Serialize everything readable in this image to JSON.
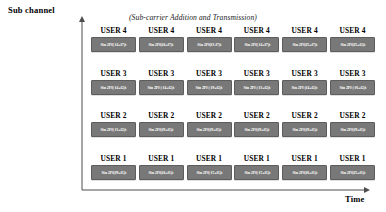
{
  "diagram": {
    "title": "(Sub-carrier Addition and Transmission)",
    "y_axis_label": "Sub channel",
    "x_axis_label": "Time",
    "box_fill_color": "#787878",
    "box_text_color": "#ffffff",
    "axis_color": "#4d4d4d",
    "rows": [
      {
        "user_label": "USER 4",
        "cells": [
          {
            "label": "USER 4",
            "expression": "Sin 2Pf( f4+f7)t"
          },
          {
            "label": "USER 4",
            "expression": "Sin 2Pf(f4+f7)t"
          },
          {
            "label": "USER 4",
            "expression": "Sin 2Pf(f3-f7)t"
          },
          {
            "label": "USER 4",
            "expression": "Sin 2Pf( f4+f7)t"
          },
          {
            "label": "USER 4",
            "expression": "Sin 2Pf(f5+f7)t"
          },
          {
            "label": "USER 4",
            "expression": "Sin 2Pf(f5+f2)t"
          }
        ]
      },
      {
        "user_label": "USER 3",
        "cells": [
          {
            "label": "USER 3",
            "expression": "Sin 2Pf( f4+f2)t"
          },
          {
            "label": "USER 3",
            "expression": "Sin 2Pf ( f4+f2)t"
          },
          {
            "label": "USER 3",
            "expression": "Sin 2Pf ( f9+f2)t"
          },
          {
            "label": "USER 3",
            "expression": "Sin 2Pf ( f3+f2)t"
          },
          {
            "label": "USER 3",
            "expression": "Sin 2Pf (f4+f2)t"
          },
          {
            "label": "USER 3",
            "expression": "Sin 2Pf ( f6+f2)t"
          }
        ]
      },
      {
        "user_label": "USER 2",
        "cells": [
          {
            "label": "USER 2",
            "expression": "Sin 2Pf( f1+f2)t"
          },
          {
            "label": "USER 2",
            "expression": "Sin 2Pf(f9+f1)t"
          },
          {
            "label": "USER 2",
            "expression": "Sin 2Pf(f9+f1)t"
          },
          {
            "label": "USER 2",
            "expression": "Sin 2Pf(f9+f1)t"
          },
          {
            "label": "USER 2",
            "expression": "Sin 2Pf(f9+f1)t"
          },
          {
            "label": "USER 2",
            "expression": "Sin 2Pf(f9+f1)t"
          }
        ]
      },
      {
        "user_label": "USER 1",
        "cells": [
          {
            "label": "USER 1",
            "expression": "Sin 2Pf(f9+f1)t"
          },
          {
            "label": "USER 1",
            "expression": "Sin 2Pf(f4+f1)t"
          },
          {
            "label": "USER 1",
            "expression": "Sin 2Pf( f5+f1)t"
          },
          {
            "label": "USER 1",
            "expression": "Sin 2Pf( f5+f1)t"
          },
          {
            "label": "USER 1",
            "expression": "Sin 2Pf(f6+f1)t"
          },
          {
            "label": "USER 1",
            "expression": "Sin 2Pf(f5+f1)t"
          }
        ]
      }
    ]
  }
}
